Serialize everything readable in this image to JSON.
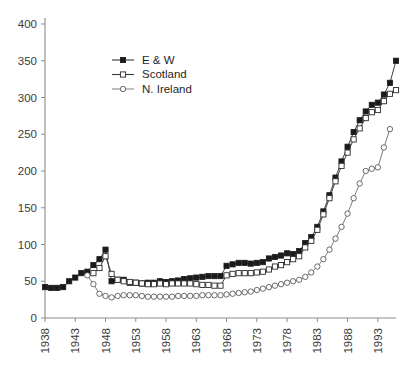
{
  "chart_data": {
    "type": "line",
    "title": "",
    "xlabel": "",
    "ylabel": "",
    "xlim": [
      1938,
      1996
    ],
    "ylim": [
      0,
      400
    ],
    "ytick_values": [
      0,
      50,
      100,
      150,
      200,
      250,
      300,
      350,
      400
    ],
    "ytick_labels": [
      "0",
      "50",
      "100",
      "150",
      "200",
      "250",
      "300",
      "350",
      "400"
    ],
    "xtick_values": [
      1938,
      1943,
      1948,
      1953,
      1958,
      1963,
      1968,
      1973,
      1978,
      1983,
      1988,
      1993
    ],
    "xtick_labels": [
      "1938",
      "1943",
      "1948",
      "1953",
      "1958",
      "1963",
      "1968",
      "1973",
      "1978",
      "1983",
      "1988",
      "1993"
    ],
    "grid": false,
    "legend_position": "upper-center",
    "series": [
      {
        "name": "E & W",
        "marker": "filled-square",
        "color": "#1a1a1a",
        "x": [
          1938,
          1939,
          1940,
          1941,
          1942,
          1943,
          1944,
          1945,
          1946,
          1947,
          1948,
          1949,
          1950,
          1951,
          1952,
          1953,
          1954,
          1955,
          1956,
          1957,
          1958,
          1959,
          1960,
          1961,
          1962,
          1963,
          1964,
          1965,
          1966,
          1967,
          1968,
          1969,
          1970,
          1971,
          1972,
          1973,
          1974,
          1975,
          1976,
          1977,
          1978,
          1979,
          1980,
          1981,
          1982,
          1983,
          1984,
          1985,
          1986,
          1987,
          1988,
          1989,
          1990,
          1991,
          1992,
          1993,
          1994,
          1995,
          1996
        ],
        "values": [
          42,
          41,
          41,
          42,
          50,
          55,
          61,
          63,
          72,
          80,
          93,
          50,
          52,
          52,
          48,
          48,
          47,
          48,
          48,
          50,
          49,
          50,
          51,
          53,
          54,
          55,
          56,
          57,
          57,
          57,
          71,
          73,
          75,
          75,
          74,
          75,
          76,
          81,
          83,
          85,
          88,
          87,
          91,
          102,
          110,
          124,
          145,
          167,
          191,
          213,
          233,
          253,
          269,
          281,
          290,
          293,
          304,
          320,
          350
        ]
      },
      {
        "name": "Scotland",
        "marker": "open-square",
        "color": "#2b2b2b",
        "x": [
          1946,
          1947,
          1948,
          1949,
          1950,
          1951,
          1952,
          1953,
          1954,
          1955,
          1956,
          1957,
          1958,
          1959,
          1960,
          1961,
          1962,
          1963,
          1964,
          1965,
          1966,
          1967,
          1968,
          1969,
          1970,
          1971,
          1972,
          1973,
          1974,
          1975,
          1976,
          1977,
          1978,
          1979,
          1980,
          1981,
          1982,
          1983,
          1984,
          1985,
          1986,
          1987,
          1988,
          1989,
          1990,
          1991,
          1992,
          1993,
          1994,
          1995,
          1996
        ],
        "values": [
          61,
          68,
          84,
          60,
          52,
          50,
          49,
          48,
          47,
          46,
          46,
          47,
          46,
          47,
          47,
          47,
          47,
          46,
          45,
          45,
          44,
          44,
          58,
          60,
          61,
          61,
          61,
          62,
          63,
          66,
          70,
          72,
          76,
          80,
          84,
          96,
          105,
          120,
          141,
          163,
          186,
          207,
          225,
          243,
          258,
          272,
          280,
          283,
          295,
          305,
          310
        ]
      },
      {
        "name": "N. Ireland",
        "marker": "open-circle",
        "color": "#5a5a5a",
        "x": [
          1945,
          1946,
          1947,
          1948,
          1949,
          1950,
          1951,
          1952,
          1953,
          1954,
          1955,
          1956,
          1957,
          1958,
          1959,
          1960,
          1961,
          1962,
          1963,
          1964,
          1965,
          1966,
          1967,
          1968,
          1969,
          1970,
          1971,
          1972,
          1973,
          1974,
          1975,
          1976,
          1977,
          1978,
          1979,
          1980,
          1981,
          1982,
          1983,
          1984,
          1985,
          1986,
          1987,
          1988,
          1989,
          1990,
          1991,
          1992,
          1993,
          1994,
          1995
        ],
        "values": [
          58,
          46,
          33,
          30,
          28,
          30,
          31,
          31,
          31,
          30,
          29,
          29,
          29,
          29,
          29,
          30,
          30,
          30,
          30,
          31,
          31,
          31,
          31,
          32,
          33,
          34,
          35,
          36,
          38,
          40,
          42,
          44,
          46,
          48,
          50,
          52,
          56,
          62,
          70,
          80,
          93,
          108,
          124,
          142,
          163,
          183,
          200,
          203,
          205,
          232,
          257
        ]
      }
    ]
  },
  "legend": {
    "items": [
      {
        "label": "E & W"
      },
      {
        "label": "Scotland"
      },
      {
        "label": "N. Ireland"
      }
    ]
  }
}
